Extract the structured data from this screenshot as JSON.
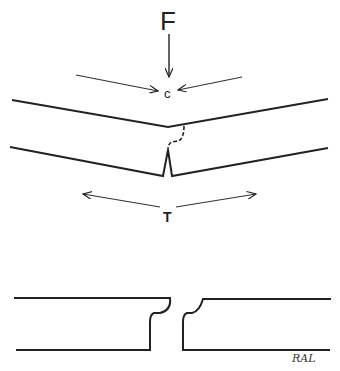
{
  "diagram": {
    "type": "beam-fracture-illustration",
    "labels": {
      "force": "F",
      "compression": "c",
      "tension": "T",
      "signature": "RAL"
    },
    "panels": [
      {
        "name": "bent-beam",
        "description": "Beam under load F bending with compression on top (c) and tension on bottom (T), crack forming at center"
      },
      {
        "name": "fractured-beam",
        "description": "Beam broken into two pieces with stepped fracture surfaces"
      }
    ],
    "colors": {
      "stroke": "#222222",
      "background": "#ffffff"
    }
  }
}
